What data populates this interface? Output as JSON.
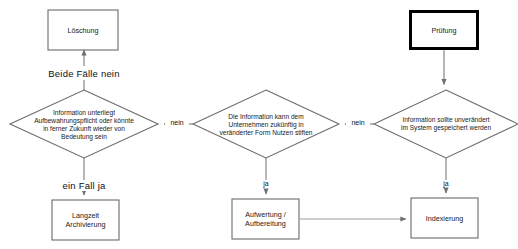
{
  "diagram": {
    "type": "flowchart",
    "background_color": "#ffffff",
    "line_color": "#7a7a7a",
    "text_color": "#1a1a1a",
    "start_node_border_color": "#000000"
  },
  "nodes": {
    "loeschung": {
      "label": "Löschung",
      "shape": "rectangle",
      "x": 48,
      "y": 10,
      "w": 70,
      "h": 40,
      "border": "thin"
    },
    "pruefung": {
      "label": "Prüfung",
      "shape": "rectangle",
      "x": 409,
      "y": 10,
      "w": 70,
      "h": 40,
      "border": "thick"
    },
    "langzeit": {
      "label_line1": "Langzeit",
      "label_line2": "Archivierung",
      "shape": "rectangle",
      "x": 52,
      "y": 200,
      "w": 67,
      "h": 40,
      "border": "thin"
    },
    "aufwertung": {
      "label_line1": "Aufwertung /",
      "label_line2": "Aufbereitung",
      "shape": "rectangle",
      "x": 232,
      "y": 199,
      "w": 67,
      "h": 40,
      "border": "thin"
    },
    "indexierung": {
      "label": "Indexierung",
      "shape": "rectangle",
      "x": 411,
      "y": 198,
      "w": 67,
      "h": 40,
      "border": "thin"
    },
    "decision_left": {
      "shape": "diamond",
      "lines": [
        "Information unterliegt",
        "Aufbewahrungspflicht oder könnte",
        "in ferner Zukunft wieder von",
        "Bedeutung sein"
      ],
      "cx": 84,
      "cy": 124,
      "rx": 74,
      "ry": 34
    },
    "decision_middle": {
      "shape": "diamond",
      "lines": [
        "Die Information kann dem",
        "Unternehmen zukünftig in",
        "veränderter Form Nutzen stiften"
      ],
      "cx": 266,
      "cy": 124,
      "rx": 73,
      "ry": 34
    },
    "decision_right": {
      "shape": "diamond",
      "lines": [
        "Information sollte unverändert",
        "im System gespeichert werden"
      ],
      "cx": 446,
      "cy": 124,
      "rx": 72,
      "ry": 34
    }
  },
  "edges": [
    {
      "name": "pruefung-to-decision-right",
      "label": "",
      "from": "pruefung",
      "to": "decision_right",
      "arrow": true
    },
    {
      "name": "decision-right-to-decision-middle",
      "label": "nein",
      "from": "decision_right",
      "to": "decision_middle",
      "arrow": true
    },
    {
      "name": "decision-middle-to-decision-left",
      "label": "nein",
      "from": "decision_middle",
      "to": "decision_left",
      "arrow": true
    },
    {
      "name": "decision-left-to-loeschung",
      "label": "Beide Fälle nein",
      "from": "decision_left",
      "to": "loeschung",
      "arrow": true
    },
    {
      "name": "decision-left-to-langzeit",
      "label": "ein Fall ja",
      "from": "decision_left",
      "to": "langzeit",
      "arrow": true
    },
    {
      "name": "decision-middle-to-aufwertung",
      "label": "ja",
      "from": "decision_middle",
      "to": "aufwertung",
      "arrow": true
    },
    {
      "name": "decision-right-to-indexierung",
      "label": "ja",
      "from": "decision_right",
      "to": "indexierung",
      "arrow": true
    },
    {
      "name": "aufwertung-to-indexierung",
      "label": "",
      "from": "aufwertung",
      "to": "indexierung",
      "arrow": true
    }
  ],
  "labels": {
    "beide_faelle_nein": "Beide Fälle nein",
    "ein_fall_ja": "ein Fall ja",
    "nein_right": "nein",
    "nein_middle": "nein",
    "ja_middle": "ja",
    "ja_right": "ja"
  }
}
